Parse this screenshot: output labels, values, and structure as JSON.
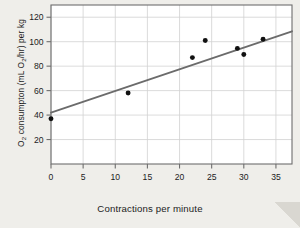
{
  "chart_data": {
    "type": "scatter",
    "title": "",
    "xlabel": "Contractions per minute",
    "ylabel_html": "O<sub>2</sub> consumpton (mL O<sub>2</sub>/hr) per kg",
    "ylabel_plain": "O2 consumpton (mL O2/hr) per kg",
    "xlim": [
      0,
      37.5
    ],
    "ylim": [
      0,
      130
    ],
    "xticks": [
      0,
      5,
      10,
      15,
      20,
      25,
      30,
      35
    ],
    "xticklabels": [
      "0",
      "5",
      "10",
      "15",
      "20",
      "25",
      "30",
      "35"
    ],
    "yticks": [
      20,
      40,
      60,
      80,
      100,
      120
    ],
    "yticklabels": [
      "20",
      "40",
      "60",
      "80",
      "100",
      "120"
    ],
    "grid": true,
    "grid_axis": "both",
    "legend": null,
    "points": [
      {
        "x": 0,
        "y": 37
      },
      {
        "x": 12,
        "y": 58
      },
      {
        "x": 22,
        "y": 87
      },
      {
        "x": 24,
        "y": 101
      },
      {
        "x": 29,
        "y": 94.5
      },
      {
        "x": 30,
        "y": 89.5
      },
      {
        "x": 33,
        "y": 102
      }
    ],
    "trendline": {
      "type": "linear-fit",
      "x_start": 0,
      "y_start": 42,
      "x_end": 37.5,
      "y_end": 108.5,
      "slope": 1.773,
      "intercept": 42
    },
    "colors": {
      "background": "#efeeea",
      "plot_background": "#ffffff",
      "point": "#111111",
      "trendline": "#6b6b6b",
      "grid": "#d2d2d2",
      "axis": "#6e6e6e",
      "text": "#1c1c1c"
    }
  }
}
